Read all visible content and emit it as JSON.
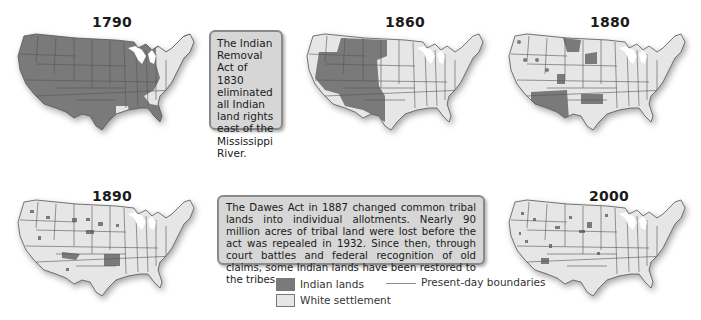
{
  "colors": {
    "indian_lands": "#7a7a7a",
    "white_settlement": "#e6e6e6",
    "boundaries": "#555555",
    "callout_bg": "#d6d6d6",
    "callout_border": "#8a8a8a"
  },
  "maps": [
    {
      "year": "1790",
      "description": "Nearly all land west of the Appalachians held as Indian lands; east coast white settlement"
    },
    {
      "year": "1860",
      "description": "Indian lands confined to the Great Plains and interior West"
    },
    {
      "year": "1880",
      "description": "Scattered reservations, large areas in Southwest, Dakota and Indian Territory"
    },
    {
      "year": "1890",
      "description": "Small scattered reservations; Indian Territory (Oklahoma) remains"
    },
    {
      "year": "2000",
      "description": "Small scattered Indian lands across the West"
    }
  ],
  "callouts": {
    "removal_act": "The Indian Removal Act of 1830 eliminated all Indian land rights east of the Mississippi River.",
    "dawes_act": "The Dawes Act in 1887 changed common tribal lands into individual allotments. Nearly 90 million acres of tribal land were lost before the act was repealed in 1932. Since then, through court battles and federal recognition of old claims, some Indian lands have been restored to the tribes."
  },
  "legend": {
    "indian_lands": "Indian lands",
    "white_settlement": "White settlement",
    "boundaries": "Present-day boundaries"
  }
}
